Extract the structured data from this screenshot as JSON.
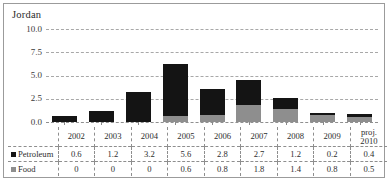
{
  "chart_data": {
    "type": "bar",
    "title": "Jordan",
    "subtitle": "",
    "xlabel": "",
    "ylabel": "",
    "stacked": true,
    "grid": true,
    "legend_position": "table-left",
    "ylim": [
      0,
      10
    ],
    "yticks": [
      "0.0",
      "2.5",
      "5.0",
      "7.5",
      "10.0"
    ],
    "ytick_values": [
      0,
      2.5,
      5,
      7.5,
      10
    ],
    "categories": [
      "2002",
      "2003",
      "2004",
      "2005",
      "2006",
      "2007",
      "2008",
      "2009",
      "proj. 2010"
    ],
    "category_labels_line1": [
      "2002",
      "2003",
      "2004",
      "2005",
      "2006",
      "2007",
      "2008",
      "2009",
      "proj."
    ],
    "category_labels_line2": [
      "",
      "",
      "",
      "",
      "",
      "",
      "",
      "",
      "2010"
    ],
    "series": [
      {
        "name": "Petroleum",
        "color": "#141414",
        "values": [
          0.6,
          1.2,
          3.2,
          5.6,
          2.8,
          2.7,
          1.2,
          0.2,
          0.4
        ],
        "display_values": [
          "0.6",
          "1.2",
          "3.2",
          "5.6",
          "2.8",
          "2.7",
          "1.2",
          "0.2",
          "0.4"
        ]
      },
      {
        "name": "Food",
        "color": "#8e8e8e",
        "values": [
          0,
          0,
          0,
          0.6,
          0.8,
          1.8,
          1.4,
          0.8,
          0.5
        ],
        "display_values": [
          "0",
          "0",
          "0",
          "0.6",
          "0.8",
          "1.8",
          "1.4",
          "0.8",
          "0.5"
        ]
      }
    ]
  },
  "title": "Jordan",
  "legend": {
    "petroleum_label": "Petroleum",
    "food_label": "Food"
  }
}
